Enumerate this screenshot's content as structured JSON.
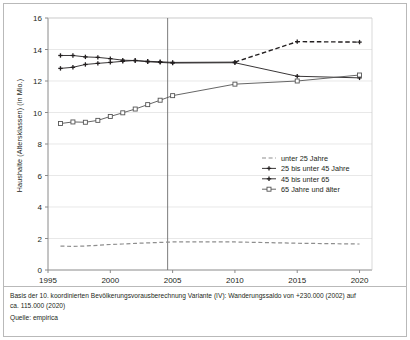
{
  "chart_data": {
    "type": "line",
    "title": "",
    "xlabel": "",
    "ylabel": "Haushalte (Altersklassen) (in Mio.)",
    "xlim": [
      1995,
      2021
    ],
    "ylim": [
      0,
      16
    ],
    "yticks": [
      0,
      2,
      4,
      6,
      8,
      10,
      12,
      14,
      16
    ],
    "xticks": [
      1995,
      2000,
      2005,
      2010,
      2015,
      2020
    ],
    "xtick_labels": [
      "1995",
      "2000",
      "2005",
      "2010",
      "2015",
      "2020"
    ],
    "ytick_labels": [
      "0",
      "2",
      "4",
      "6",
      "8",
      "10",
      "12",
      "14",
      "16"
    ],
    "grid": "horizontal",
    "legend_position": "center-right",
    "reference_line_x": 2004.6,
    "series": [
      {
        "name": "unter 25 Jahre",
        "style": "dashed",
        "marker": "none",
        "color": "#8e8e8e",
        "x": [
          1996,
          1997,
          1998,
          1999,
          2000,
          2001,
          2002,
          2003,
          2004,
          2005,
          2010,
          2015,
          2020
        ],
        "values": [
          1.52,
          1.5,
          1.52,
          1.57,
          1.62,
          1.65,
          1.69,
          1.72,
          1.75,
          1.78,
          1.78,
          1.7,
          1.65
        ]
      },
      {
        "name": "25 bis unter 45 Jahre",
        "style": "solid",
        "marker": "plus",
        "color": "#231f20",
        "x": [
          1996,
          1997,
          1998,
          1999,
          2000,
          2001,
          2002,
          2003,
          2004,
          2005,
          2010,
          2015,
          2020
        ],
        "values": [
          12.8,
          12.87,
          13.05,
          13.12,
          13.18,
          13.25,
          13.3,
          13.22,
          13.18,
          13.14,
          13.16,
          12.3,
          12.2
        ]
      },
      {
        "name": "45 bis unter 65",
        "style": "solid-then-dashed",
        "marker": "plus",
        "color": "#231f20",
        "x": [
          1996,
          1997,
          1998,
          1999,
          2000,
          2001,
          2002,
          2003,
          2004,
          2005,
          2010,
          2015,
          2020
        ],
        "values": [
          13.62,
          13.62,
          13.53,
          13.5,
          13.42,
          13.32,
          13.3,
          13.25,
          13.22,
          13.18,
          13.2,
          14.5,
          14.47
        ]
      },
      {
        "name": "65 Jahre und älter",
        "style": "solid",
        "marker": "square",
        "color": "#555555",
        "x": [
          1996,
          1997,
          1998,
          1999,
          2000,
          2001,
          2002,
          2003,
          2004,
          2005,
          2010,
          2015,
          2020
        ],
        "values": [
          9.3,
          9.4,
          9.38,
          9.5,
          9.75,
          9.98,
          10.22,
          10.5,
          10.78,
          11.07,
          11.8,
          12.0,
          12.38
        ]
      }
    ],
    "legend": [
      {
        "label": "unter 25 Jahre",
        "style": "dashed",
        "marker": "none",
        "color": "#8e8e8e"
      },
      {
        "label": "25 bis unter 45 Jahre",
        "style": "solid",
        "marker": "plus",
        "color": "#231f20"
      },
      {
        "label": "45 bis unter 65",
        "style": "solid",
        "marker": "plus",
        "color": "#231f20"
      },
      {
        "label": "65 Jahre und älter",
        "style": "solid",
        "marker": "square",
        "color": "#555555"
      }
    ]
  },
  "footnotes": {
    "line1": "Basis der 10. koordinierten Bevölkerungsvorausberechnung Variante (IV): Wanderungssaldo von +230.000 (2002) auf",
    "line2": "ca. 115.000 (2020)",
    "line3": "Quelle: empirica"
  }
}
